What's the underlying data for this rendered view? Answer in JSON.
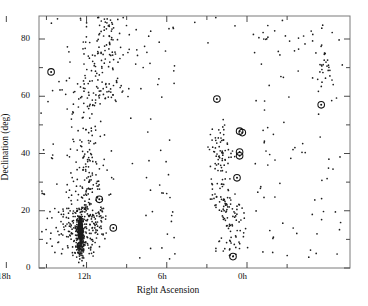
{
  "chart_data": {
    "type": "scatter",
    "title": "",
    "xlabel": "Right Ascension",
    "ylabel": "Declination (deg)",
    "xlim": [
      15.0,
      15.0
    ],
    "ylim": [
      0,
      88
    ],
    "grid": false,
    "legend": null,
    "x_tick_labels": [
      "12h",
      "6h",
      "0h",
      "18h"
    ],
    "x_tick_values": [
      12,
      6,
      0,
      18
    ],
    "y_tick_labels": [
      "0",
      "20",
      "40",
      "60",
      "80"
    ],
    "y_tick_values": [
      0,
      20,
      40,
      60,
      80
    ],
    "y_minor_ticks": [
      10,
      30,
      50,
      70
    ],
    "x_axis_direction": "decreasing-right-ascension",
    "series": [
      {
        "name": "galaxies",
        "marker": "dot",
        "color": "#1a1a1a",
        "description": "Several hundred small point markers; strongly concentrated near 12h (Virgo cluster overdensity) with a dense near-solid clump at RA~12.3h, Dec~13 deg; a secondary looser concentration between 2h and 0h; sparse scatter near 18h."
      },
      {
        "name": "circled-objects",
        "marker": "open-circle-with-dot",
        "color": "#111111",
        "points": [
          {
            "ra_h": 14.65,
            "dec": 68.5
          },
          {
            "ra_h": 2.25,
            "dec": 59.0
          },
          {
            "ra_h": 18.45,
            "dec": 57.0
          },
          {
            "ra_h": 0.55,
            "dec": 47.8
          },
          {
            "ra_h": 0.35,
            "dec": 47.3
          },
          {
            "ra_h": 0.55,
            "dec": 40.5
          },
          {
            "ra_h": 0.55,
            "dec": 39.2
          },
          {
            "ra_h": 0.75,
            "dec": 31.5
          },
          {
            "ra_h": 11.05,
            "dec": 24.0
          },
          {
            "ra_h": 10.0,
            "dec": 14.0
          },
          {
            "ra_h": 1.05,
            "dec": 4.0
          }
        ]
      }
    ],
    "curve": {
      "name": "survey-boundary",
      "shape": "inverted-parabola",
      "color": "#000000",
      "linewidth": 1.6,
      "apex": {
        "ra_h": 0.55,
        "dec": 61.5
      },
      "left_endpoint": {
        "ra_h": 6.6,
        "dec": 0
      },
      "right_endpoint": {
        "ra_h": 17.1,
        "dec": 0
      }
    }
  },
  "axes": {
    "x_title": "Right Ascension",
    "y_title": "Declination (deg)"
  }
}
